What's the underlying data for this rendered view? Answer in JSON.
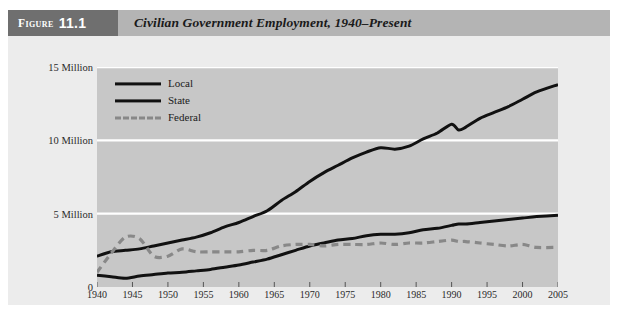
{
  "figure": {
    "number_word": "Figure",
    "number": "11.1",
    "title": "Civilian Government Employment, 1940–Present"
  },
  "legend": {
    "position": "inside-top-left",
    "entries": [
      {
        "label": "Local",
        "style": "solid",
        "color": "#111111"
      },
      {
        "label": "State",
        "style": "solid",
        "color": "#111111"
      },
      {
        "label": "Federal",
        "style": "dashed",
        "color": "#888888"
      }
    ]
  },
  "axes": {
    "y_tick_labels": [
      "15 Million",
      "10 Million",
      "5 Million",
      "0"
    ],
    "y_tick_values": [
      15,
      10,
      5,
      0
    ],
    "x_tick_labels": [
      "1940",
      "1945",
      "1950",
      "1955",
      "1960",
      "1965",
      "1970",
      "1975",
      "1980",
      "1985",
      "1990",
      "1995",
      "2000",
      "2005"
    ]
  },
  "colors": {
    "page_background": "#ffffff",
    "card_background": "#ececec",
    "header_box": "#6f6f6f",
    "header_band": "#b4b4b4",
    "plot_background": "#c7c7c7",
    "gridline": "#ffffff",
    "local_line": "#111111",
    "state_line": "#111111",
    "federal_line": "#888888",
    "text": "#1a1a1a"
  },
  "chart_data": {
    "type": "line",
    "title": "Civilian Government Employment, 1940–Present",
    "xlabel": "",
    "ylabel": "",
    "units": "Millions of employees",
    "xlim": [
      1940,
      2005
    ],
    "ylim": [
      0,
      15
    ],
    "grid": true,
    "gridlines_y": [
      5,
      10,
      15
    ],
    "legend_position": "inside-top-left",
    "x": [
      1940,
      1942,
      1944,
      1946,
      1948,
      1950,
      1952,
      1954,
      1956,
      1958,
      1960,
      1962,
      1964,
      1966,
      1968,
      1970,
      1972,
      1974,
      1976,
      1978,
      1980,
      1982,
      1984,
      1986,
      1988,
      1990,
      1991,
      1992,
      1994,
      1996,
      1998,
      2000,
      2002,
      2005
    ],
    "series": [
      {
        "name": "Local",
        "style": "solid",
        "color": "#111111",
        "values": [
          2.1,
          2.4,
          2.5,
          2.6,
          2.8,
          3.0,
          3.2,
          3.4,
          3.7,
          4.1,
          4.4,
          4.8,
          5.2,
          5.9,
          6.5,
          7.2,
          7.8,
          8.3,
          8.8,
          9.2,
          9.5,
          9.4,
          9.6,
          10.1,
          10.5,
          11.1,
          10.7,
          10.9,
          11.5,
          11.9,
          12.3,
          12.8,
          13.3,
          13.8
        ]
      },
      {
        "name": "State",
        "style": "solid",
        "color": "#111111",
        "values": [
          0.8,
          0.7,
          0.6,
          0.75,
          0.85,
          0.95,
          1.0,
          1.1,
          1.2,
          1.35,
          1.5,
          1.7,
          1.9,
          2.2,
          2.5,
          2.8,
          3.0,
          3.2,
          3.3,
          3.5,
          3.6,
          3.6,
          3.7,
          3.9,
          4.0,
          4.2,
          4.3,
          4.3,
          4.4,
          4.5,
          4.6,
          4.7,
          4.8,
          4.9
        ]
      },
      {
        "name": "Federal",
        "style": "dashed",
        "color": "#888888",
        "values": [
          1.0,
          2.3,
          3.4,
          3.3,
          2.1,
          2.1,
          2.6,
          2.4,
          2.4,
          2.4,
          2.4,
          2.5,
          2.5,
          2.8,
          2.9,
          2.9,
          2.8,
          2.9,
          2.9,
          2.9,
          3.0,
          2.9,
          3.0,
          3.0,
          3.1,
          3.2,
          3.1,
          3.1,
          3.0,
          2.9,
          2.8,
          2.9,
          2.7,
          2.7
        ]
      }
    ]
  }
}
